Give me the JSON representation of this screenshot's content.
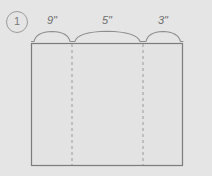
{
  "figure": {
    "problem_number": "1",
    "shape": "rectangle",
    "unit": "inches",
    "unit_symbol": "\"",
    "segments": [
      {
        "label": "9\"",
        "value": 9,
        "brace": "arc"
      },
      {
        "label": "5\"",
        "value": 5,
        "brace": "arc"
      },
      {
        "label": "3\"",
        "value": 3,
        "brace": "arc"
      }
    ],
    "total_label": "17\"",
    "colors": {
      "background": "#e5e5e5",
      "outline": "#7c7c7c",
      "dashed_divider": "#9a9a9a",
      "brace": "#8a8a8a",
      "text": "#6d6d6d",
      "fill": "#e3e3e3"
    },
    "geometry": {
      "rect_left": 31,
      "rect_top": 43,
      "rect_right": 183,
      "rect_bottom": 166,
      "divider_x": [
        72,
        143
      ],
      "brace_y": 40,
      "label_y": 21
    }
  }
}
